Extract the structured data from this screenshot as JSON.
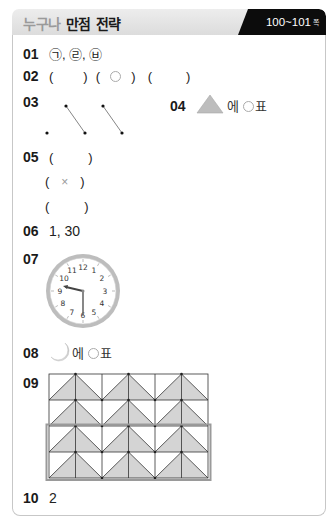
{
  "header": {
    "title_muted": "누구나",
    "title_strong": "만점 전략",
    "page_range": "100~101",
    "page_unit": "쪽"
  },
  "answers": {
    "q01": {
      "number": "01",
      "text": "㉠, ㉣, ㉥"
    },
    "q02": {
      "number": "02",
      "parens": [
        "(        )",
        "(  ○  )",
        "(        )"
      ]
    },
    "q03": {
      "number": "03",
      "description": "dot matching: top dots 2 and 3 connected diagonally to bottom dots 2 and 3"
    },
    "q04": {
      "number": "04",
      "shape": "triangle",
      "suffix": "에",
      "mark_label": "표"
    },
    "q05": {
      "number": "05",
      "rows": [
        "(        )",
        "(   ×   )",
        "(        )"
      ],
      "mark": "×"
    },
    "q06": {
      "number": "06",
      "text": "1, 30"
    },
    "q07": {
      "number": "07",
      "clock": {
        "hour": 9,
        "minute": 30,
        "numerals": [
          "12",
          "1",
          "2",
          "3",
          "4",
          "5",
          "6",
          "7",
          "8",
          "9",
          "10",
          "11"
        ]
      }
    },
    "q08": {
      "number": "08",
      "shape": "crescent-moon",
      "suffix": "에",
      "mark_label": "표"
    },
    "q09": {
      "number": "09",
      "grid": {
        "columns": 6,
        "rows": 4,
        "highlighted_rows": [
          3,
          4
        ]
      }
    },
    "q10": {
      "number": "10",
      "text": "2"
    }
  },
  "colors": {
    "badge_bg": "#0c0c0c",
    "header_bg": "#e4e4e4",
    "muted_text": "#9a9a9a",
    "shape_fill": "#c8c8c8",
    "grid_fill": "#d4d4d4",
    "card_border": "#c7c7c7"
  }
}
